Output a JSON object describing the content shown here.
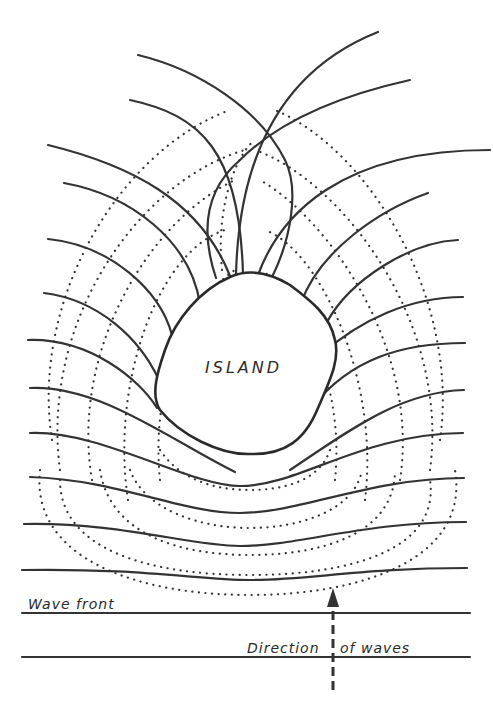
{
  "diagram": {
    "type": "wave refraction around an island",
    "labels": {
      "island": "ISLAND",
      "wave_front": "Wave front",
      "direction_part1": "Direction",
      "direction_part2": "of waves"
    },
    "legend": {
      "solid_lines": "wave crests (wave fronts)",
      "dotted_lines": "orthogonals / refracted wave paths",
      "dashed_arrow": "direction of wave travel (upward)"
    },
    "colors": {
      "ink": "#333333",
      "background": "#ffffff"
    }
  }
}
